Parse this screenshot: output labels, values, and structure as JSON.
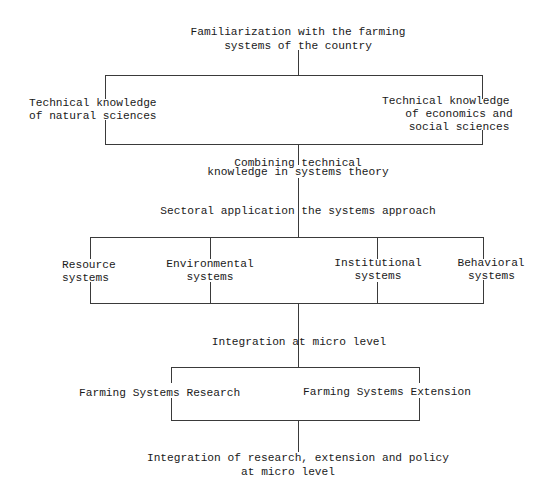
{
  "diagram": {
    "title": [
      "Familiarization with the farming",
      "systems of the country"
    ],
    "knowledge_branch": {
      "left": [
        "Technical knowledge",
        "of natural sciences"
      ],
      "right": [
        "Technical knowledge",
        "of economics and",
        "social sciences"
      ]
    },
    "combining": [
      "Combining technical",
      "knowledge in systems theory"
    ],
    "sectoral": "Sectoral application the systems approach",
    "systems": [
      {
        "lines": [
          "Resource",
          "systems"
        ]
      },
      {
        "lines": [
          "Environmental",
          "systems"
        ]
      },
      {
        "lines": [
          "Institutional",
          "systems"
        ]
      },
      {
        "lines": [
          "Behavioral",
          "systems"
        ]
      }
    ],
    "integration_micro": "Integration at micro level",
    "farming_systems": {
      "research": "Farming Systems Research",
      "extension": "Farming Systems Extension"
    },
    "final": [
      "Integration of research, extension and policy",
      "at micro level"
    ]
  }
}
